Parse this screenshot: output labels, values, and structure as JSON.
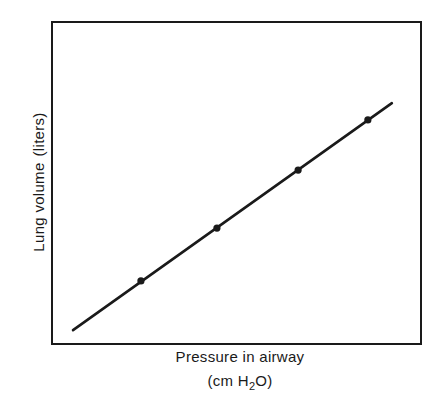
{
  "chart_data": {
    "type": "line",
    "title": "",
    "xlabel": "Pressure in airway (cm H2O)",
    "xlabel_line1": "Pressure in airway",
    "xlabel_line2_prefix": "(cm H",
    "xlabel_line2_sub": "2",
    "xlabel_line2_suffix": "O)",
    "ylabel": "Lung volume (liters)",
    "ylabel_part1": "Lung volume",
    "ylabel_part2": "(liters)",
    "x_ticks": [],
    "y_ticks": [],
    "grid": false,
    "legend": null,
    "units_note": "No numeric tick labels shown; values are relative positions within the plot frame (0-1).",
    "xlim": [
      0,
      1
    ],
    "ylim": [
      0,
      1
    ],
    "series": [
      {
        "name": "pressure-volume line",
        "style": "solid line",
        "color": "#1a1a1a",
        "line_x": [
          0.057,
          0.921
        ],
        "line_y": [
          0.043,
          0.748
        ],
        "markers": {
          "x": [
            0.241,
            0.447,
            0.667,
            0.856
          ],
          "y": [
            0.196,
            0.36,
            0.54,
            0.696
          ]
        }
      }
    ]
  },
  "layout": {
    "frame": {
      "x1": 52,
      "y1": 22,
      "x2": 421,
      "y2": 344
    },
    "colors": {
      "ink": "#1a1a1a",
      "background": "#ffffff"
    }
  }
}
